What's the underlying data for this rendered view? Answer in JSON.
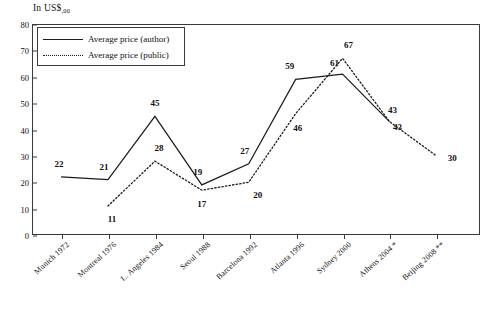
{
  "chart_data": {
    "type": "line",
    "title": "",
    "ylabel": "In US$,00",
    "xlabel": "",
    "ylim": [
      0,
      80
    ],
    "yticks": [
      0,
      10,
      20,
      30,
      40,
      50,
      60,
      70,
      80
    ],
    "grid": false,
    "legend_position": "top-left",
    "categories": [
      "Munich 1972",
      "Montreal 1976",
      "L. Angeles 1984",
      "Seoul 1988",
      "Barcelona 1992",
      "Atlanta 1996",
      "Sydney 2000",
      "Athens 2004 *",
      "Beijing 2008 **"
    ],
    "series": [
      {
        "name": "Average price (author)",
        "style": "solid",
        "values": [
          22,
          21,
          45,
          19,
          27,
          59,
          61,
          43,
          null
        ]
      },
      {
        "name": "Average price (public)",
        "style": "dotted",
        "values": [
          null,
          11,
          28,
          17,
          20,
          46,
          67,
          43,
          30
        ]
      }
    ],
    "point_labels": {
      "author": [
        "22",
        "21",
        "45",
        "19",
        "27",
        "59",
        "61",
        "43",
        ""
      ],
      "public": [
        "",
        "11",
        "28",
        "17",
        "20",
        "46",
        "67",
        "43",
        "30"
      ]
    }
  },
  "legend": {
    "items": [
      {
        "label": "Average price (author)",
        "style": "solid"
      },
      {
        "label": "Average price (public)",
        "style": "dotted"
      }
    ]
  },
  "axis": {
    "unit_prefix": "In US$",
    "unit_suffix": ",00"
  },
  "colors": {
    "line": "#1a1a1a",
    "frame": "#3b3b3b",
    "background": "#ffffff",
    "text": "#111111"
  }
}
